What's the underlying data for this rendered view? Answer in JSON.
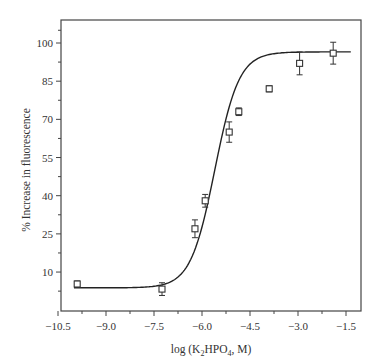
{
  "chart_data": {
    "type": "scatter",
    "title": "",
    "xlabel": "log (K2HPO4, M)",
    "xlabel_parts": {
      "pre": "log (K",
      "sub1": "2",
      "mid": "HPO",
      "sub2": "4",
      "post": ", M)"
    },
    "ylabel": "% Increase in fluorescence",
    "xlim": [
      -10.5,
      -1.2
    ],
    "ylim": [
      -5,
      108
    ],
    "x_ticks": [
      -10.5,
      -9.0,
      -7.5,
      -6.0,
      -4.5,
      -3.0,
      -1.5
    ],
    "x_tick_labels": [
      "−10.5",
      "−9.0",
      "−7.5",
      "−6.0",
      "−4.5",
      "−3.0",
      "−1.5"
    ],
    "y_ticks": [
      10,
      25,
      40,
      55,
      70,
      85,
      100
    ],
    "y_tick_labels": [
      "10",
      "25",
      "40",
      "55",
      "70",
      "85",
      "100"
    ],
    "grid": false,
    "legend": null,
    "series": [
      {
        "name": "measured",
        "marker": "open-square",
        "x": [
          -9.9,
          -7.25,
          -6.22,
          -5.9,
          -5.15,
          -4.85,
          -3.9,
          -2.95,
          -1.9
        ],
        "y": [
          5.3,
          3.3,
          27,
          38,
          65,
          73,
          82,
          92,
          96
        ],
        "err": [
          1.2,
          2.5,
          3.5,
          2.5,
          4.0,
          1.5,
          1.2,
          4.5,
          4.3
        ]
      },
      {
        "name": "fit",
        "type": "line",
        "model": "sigmoid",
        "bottom": 3.8,
        "top": 96.5,
        "x50": -5.6,
        "slope": 0.85,
        "x_range": [
          -10.0,
          -1.35
        ]
      }
    ]
  }
}
